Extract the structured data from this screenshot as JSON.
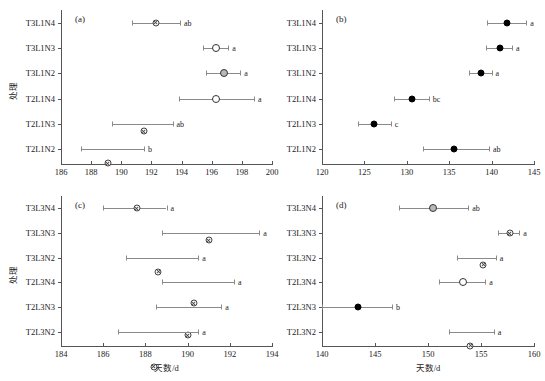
{
  "figure": {
    "width": 545,
    "height": 381,
    "y_axis_title": "处理",
    "x_axis_title": "天数/d"
  },
  "chart_data": [
    {
      "type": "scatter",
      "panel": "(a)",
      "title": "",
      "xlabel": "",
      "ylabel": "处理",
      "xlim": [
        186,
        200
      ],
      "xticks": [
        186,
        188,
        190,
        192,
        194,
        196,
        198,
        200
      ],
      "grid": false,
      "legend": "none",
      "categories": [
        "T3L1N4",
        "T3L1N3",
        "T3L1N2",
        "T2L1N4",
        "T2L1N3",
        "T2L1N2"
      ],
      "values": [
        192.3,
        196.3,
        196.8,
        196.3,
        191.5,
        189.1
      ],
      "err_low": [
        190.7,
        195.4,
        195.6,
        193.8,
        189.4,
        187.3
      ],
      "err_high": [
        193.9,
        197.1,
        197.9,
        198.8,
        193.4,
        191.5
      ],
      "markers": [
        "cross",
        "open",
        "gray",
        "open",
        "cross",
        "cross"
      ],
      "sig_letters": [
        "ab",
        "a",
        "a",
        "a",
        "ab",
        "b"
      ]
    },
    {
      "type": "scatter",
      "panel": "(b)",
      "title": "",
      "xlabel": "",
      "ylabel": "处理",
      "xlim": [
        120,
        145
      ],
      "xticks": [
        120,
        125,
        130,
        135,
        140,
        145
      ],
      "grid": false,
      "legend": "none",
      "categories": [
        "T3L1N4",
        "T3L1N3",
        "T3L1N2",
        "T2L1N4",
        "T2L1N3",
        "T2L1N2"
      ],
      "values": [
        141.8,
        141.0,
        138.8,
        130.6,
        126.1,
        135.6
      ],
      "err_low": [
        139.4,
        139.3,
        137.3,
        128.5,
        124.2,
        131.9
      ],
      "err_high": [
        144.1,
        142.4,
        140.0,
        132.6,
        128.1,
        139.7
      ],
      "markers": [
        "filled",
        "filled",
        "filled",
        "filled",
        "filled",
        "filled"
      ],
      "sig_letters": [
        "a",
        "a",
        "a",
        "bc",
        "c",
        "ab"
      ]
    },
    {
      "type": "scatter",
      "panel": "(c)",
      "title": "",
      "xlabel": "天数/d",
      "ylabel": "处理",
      "xlim": [
        184,
        194
      ],
      "xticks": [
        184,
        186,
        188,
        190,
        192,
        194
      ],
      "grid": false,
      "legend": "none",
      "categories": [
        "T3L3N4",
        "T3L3N3",
        "T3L3N2",
        "T2L3N4",
        "T2L3N3",
        "T2L3N2"
      ],
      "values": [
        187.6,
        191.0,
        188.6,
        190.3,
        190.0,
        188.4
      ],
      "err_low": [
        186.0,
        188.8,
        187.1,
        188.8,
        188.5,
        186.7
      ],
      "err_high": [
        189.0,
        193.4,
        190.5,
        192.2,
        191.6,
        190.5
      ],
      "markers": [
        "cross",
        "cross",
        "cross",
        "cross",
        "cross",
        "cross"
      ],
      "sig_letters": [
        "a",
        "a",
        "a",
        "a",
        "a",
        "a"
      ]
    },
    {
      "type": "scatter",
      "panel": "(d)",
      "title": "",
      "xlabel": "天数/d",
      "ylabel": "处理",
      "xlim": [
        140,
        160
      ],
      "xticks": [
        140,
        145,
        150,
        155,
        160
      ],
      "grid": false,
      "legend": "none",
      "categories": [
        "T3L3N4",
        "T3L3N3",
        "T3L3N2",
        "T2L3N4",
        "T2L3N3",
        "T2L3N2"
      ],
      "values": [
        150.5,
        157.7,
        155.2,
        153.3,
        143.4,
        154.0
      ],
      "err_low": [
        147.3,
        156.6,
        152.7,
        151.0,
        140.0,
        152.0
      ],
      "err_high": [
        153.8,
        158.6,
        156.4,
        155.4,
        146.6,
        156.2
      ],
      "markers": [
        "gray",
        "cross",
        "cross",
        "open",
        "filled",
        "cross"
      ],
      "sig_letters": [
        "ab",
        "a",
        "a",
        "a",
        "b",
        "a"
      ]
    }
  ]
}
